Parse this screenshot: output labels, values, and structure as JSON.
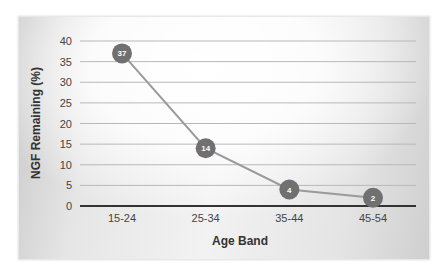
{
  "chart_data": {
    "type": "line",
    "title": "",
    "xlabel": "Age Band",
    "ylabel": "NGF Remaining (%)",
    "categories": [
      "15-24",
      "25-34",
      "35-44",
      "45-54"
    ],
    "values": [
      37,
      14,
      4,
      2
    ],
    "data_labels": [
      "37",
      "14",
      "4",
      "2"
    ],
    "ylim": [
      0,
      40
    ],
    "yticks": [
      "0",
      "5",
      "10",
      "15",
      "20",
      "25",
      "30",
      "35",
      "40"
    ],
    "grid": true,
    "legend": "none",
    "colors": {
      "line": "#9a9a9a",
      "marker": "#707070",
      "grid": "#b8b8b8",
      "baseline": "#333333"
    }
  }
}
